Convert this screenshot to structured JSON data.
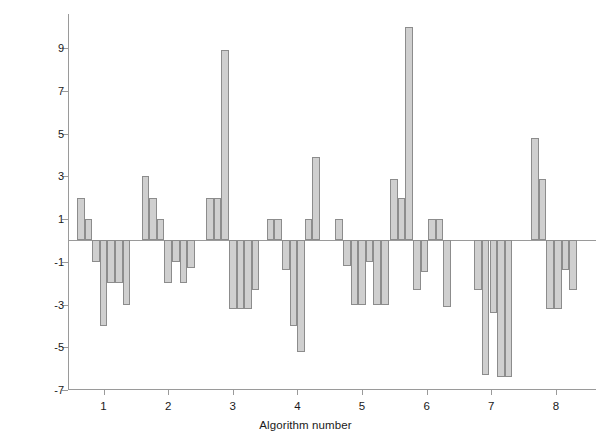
{
  "chart_data": {
    "type": "bar",
    "title": "",
    "xlabel": "Algorithm number",
    "ylabel": "Postmortem interval error (hours)",
    "ylim": [
      -7,
      10.6
    ],
    "xlim": [
      0.45,
      8.62
    ],
    "grid": false,
    "legend": null,
    "ytick_labels": [
      "9",
      "7",
      "5",
      "3",
      "1",
      "-1",
      "-3",
      "-5",
      "-7"
    ],
    "ytick_values": [
      9,
      7,
      5,
      3,
      1,
      -1,
      -3,
      -5,
      -7
    ],
    "xtick_labels": [
      "1",
      "2",
      "3",
      "4",
      "5",
      "6",
      "7",
      "8"
    ],
    "xtick_values": [
      1,
      2,
      3,
      4,
      5,
      6,
      7,
      8
    ],
    "bar_fill_color": "#cfcfcf",
    "bar_edge_color": "#8c8c8c",
    "axis_color": "#9a9a9a",
    "groups": [
      {
        "algorithm": 1,
        "values": [
          2.0,
          1.0,
          -1.0,
          -4.0,
          -2.0,
          -2.0,
          -3.0
        ]
      },
      {
        "algorithm": 2,
        "values": [
          3.0,
          2.0,
          1.0,
          -2.0,
          -1.0,
          -2.0,
          -1.3
        ]
      },
      {
        "algorithm": 3,
        "values": [
          2.0,
          2.0,
          8.9,
          -3.2,
          -3.2,
          -3.2,
          -2.3
        ]
      },
      {
        "algorithm": 4,
        "values": [
          1.0,
          1.0,
          -1.4,
          -4.0,
          -5.2,
          1.0,
          3.9
        ]
      },
      {
        "algorithm": 5,
        "values": [
          1.0,
          -1.2,
          -3.0,
          -3.0,
          -1.0,
          -3.0,
          -3.0
        ]
      },
      {
        "algorithm": 6,
        "values": [
          2.9,
          2.0,
          10.0,
          -2.3,
          -1.5,
          1.0,
          1.0,
          -3.1
        ]
      },
      {
        "algorithm": 7,
        "values": [
          -2.3,
          -6.3,
          -3.4,
          -6.4,
          -6.4
        ]
      },
      {
        "algorithm": 8,
        "values": [
          4.8,
          2.9,
          -3.2,
          -3.2,
          -1.4,
          -2.3
        ]
      }
    ]
  }
}
